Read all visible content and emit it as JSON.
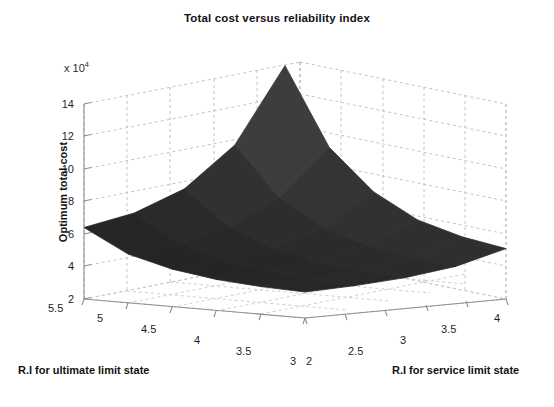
{
  "chart_data": {
    "type": "surface",
    "title": "Total cost versus reliability index",
    "xlabel": "R.I for service limit state",
    "ylabel": "R.I for ultimate limit state",
    "zlabel": "Optimum total cost",
    "z_exponent_label": "x 10",
    "z_exponent_power": "4",
    "z_scale": 10000,
    "grid": true,
    "legend": "none",
    "projection": "3d-surface-mesh",
    "surface_color": "#2b2b2b",
    "grid_color": "#b9b9b9",
    "axis_color": "#9a9a9a",
    "x_label_axis": "R.I for service limit state",
    "x_ticks": [
      2,
      2.5,
      3,
      3.5,
      4
    ],
    "x_tick_labels": [
      "2",
      "2.5",
      "3",
      "3.5",
      "4"
    ],
    "x_range": [
      2,
      4
    ],
    "y_label_axis": "R.I for ultimate limit state",
    "y_ticks": [
      5.5,
      5,
      4.5,
      4,
      3.5,
      3
    ],
    "y_tick_labels": [
      "5.5",
      "5",
      "4.5",
      "4",
      "3.5",
      "3"
    ],
    "y_range": [
      3,
      5.5
    ],
    "z_ticks": [
      2,
      4,
      6,
      8,
      10,
      12,
      14
    ],
    "z_tick_labels": [
      "2",
      "4",
      "6",
      "8",
      "10",
      "12",
      "14"
    ],
    "z_range": [
      2,
      14
    ],
    "x_values": [
      2.0,
      2.5,
      3.0,
      3.5,
      4.0
    ],
    "y_values": [
      3.0,
      3.5,
      4.0,
      4.5,
      5.0,
      5.5
    ],
    "z_values": [
      [
        3.6,
        3.7,
        3.9,
        4.3,
        5.1
      ],
      [
        3.7,
        3.8,
        4.1,
        4.6,
        5.6
      ],
      [
        3.9,
        4.1,
        4.4,
        5.1,
        6.4
      ],
      [
        4.3,
        4.5,
        5.0,
        6.0,
        7.9
      ],
      [
        5.0,
        5.4,
        6.1,
        7.6,
        10.4
      ],
      [
        6.4,
        7.0,
        8.2,
        10.6,
        15.2
      ]
    ],
    "z_min": 3.6,
    "z_max": 15.2
  },
  "axes": {
    "y_ticks": [
      {
        "label": "14",
        "top": 98
      },
      {
        "label": "12",
        "top": 130
      },
      {
        "label": "10",
        "top": 163
      },
      {
        "label": "8",
        "top": 195
      },
      {
        "label": "6",
        "top": 228
      },
      {
        "label": "4",
        "top": 260
      },
      {
        "label": "2",
        "top": 293
      }
    ],
    "left_ticks": [
      {
        "label": "5.5",
        "left": 48,
        "top": 302
      },
      {
        "label": "5",
        "left": 97,
        "top": 312
      },
      {
        "label": "4.5",
        "left": 141,
        "top": 323
      },
      {
        "label": "4",
        "left": 194,
        "top": 334
      },
      {
        "label": "3.5",
        "left": 236,
        "top": 345
      },
      {
        "label": "3",
        "left": 290,
        "top": 355
      }
    ],
    "right_ticks": [
      {
        "label": "2",
        "left": 306,
        "top": 355
      },
      {
        "label": "2.5",
        "left": 348,
        "top": 345
      },
      {
        "label": "3",
        "left": 400,
        "top": 334
      },
      {
        "label": "3.5",
        "left": 441,
        "top": 323
      },
      {
        "label": "4",
        "left": 494,
        "top": 312
      }
    ]
  }
}
